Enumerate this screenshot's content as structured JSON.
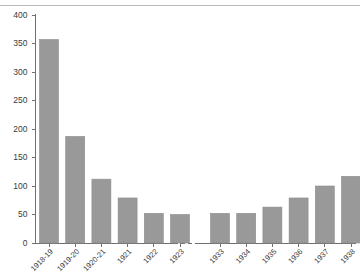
{
  "chart_data": {
    "type": "bar",
    "title": "",
    "subtitle": "",
    "xlabel": "",
    "ylabel": "",
    "ylim": [
      0,
      400
    ],
    "ytick_step": 50,
    "yticks": [
      0,
      50,
      100,
      150,
      200,
      250,
      300,
      350,
      400
    ],
    "grid": false,
    "legend": null,
    "legend_position": "none",
    "axis_break": true,
    "axis_break_note": "dashed break in x-axis between the 1923 and 1933 groups",
    "bar_color": "#999999",
    "bar_edge_color": "#8d8d8d",
    "axis_color": "#6f6f6f",
    "text_color": "#3a3a3a",
    "groups": [
      {
        "name": "group-1",
        "categories": [
          "1918-19",
          "1919-20",
          "1920-21",
          "1921",
          "1922",
          "1923"
        ],
        "values": [
          357,
          187,
          112,
          79,
          52,
          50
        ]
      },
      {
        "name": "group-2",
        "categories": [
          "1933",
          "1934",
          "1935",
          "1936",
          "1937",
          "1938"
        ],
        "values": [
          52,
          52,
          63,
          79,
          100,
          117
        ]
      }
    ],
    "categories": [
      "1918-19",
      "1919-20",
      "1920-21",
      "1921",
      "1922",
      "1923",
      "1933",
      "1934",
      "1935",
      "1936",
      "1937",
      "1938"
    ],
    "values": [
      357,
      187,
      112,
      79,
      52,
      50,
      52,
      52,
      63,
      79,
      100,
      117
    ]
  }
}
